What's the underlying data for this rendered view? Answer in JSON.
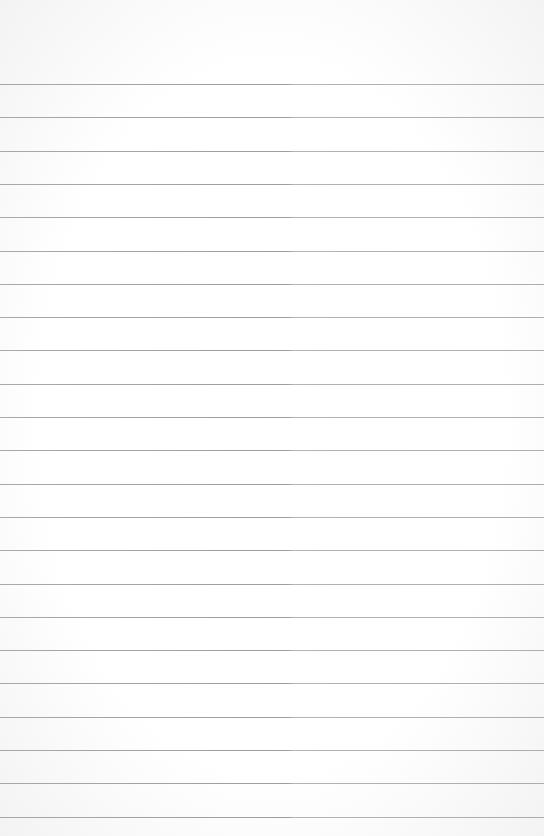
{
  "page": {
    "type": "lined-paper",
    "background_color": "#ffffff",
    "line_color": "#969696",
    "line_count": 23,
    "first_line_y": 84,
    "line_spacing": 33.3
  }
}
